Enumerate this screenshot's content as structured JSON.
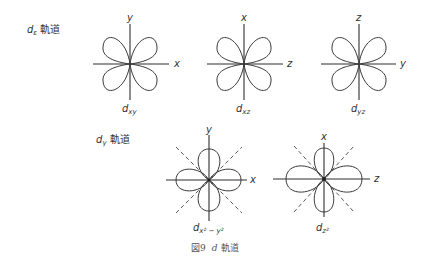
{
  "groups": [
    {
      "label_main": "d",
      "label_sub": "ε",
      "label_suffix": "軌道",
      "orbitals": [
        {
          "name": "d_xy",
          "label_main": "d",
          "label_sub": "xy",
          "label_sup": "",
          "axis_h": "x",
          "axis_v": "y"
        },
        {
          "name": "d_xz",
          "label_main": "d",
          "label_sub": "xz",
          "label_sup": "",
          "axis_h": "z",
          "axis_v": "x"
        },
        {
          "name": "d_yz",
          "label_main": "d",
          "label_sub": "yz",
          "label_sup": "",
          "axis_h": "y",
          "axis_v": "z"
        }
      ]
    },
    {
      "label_main": "d",
      "label_sub": "γ",
      "label_suffix": "軌道",
      "orbitals": [
        {
          "name": "d_x2-y2",
          "label_main": "d",
          "label_sub": "x² − y²",
          "axis_h": "x",
          "axis_v": "y"
        },
        {
          "name": "d_z2",
          "label_main": "d",
          "label_sub": "z²",
          "axis_h": "z",
          "axis_v": "x"
        }
      ]
    }
  ],
  "caption": {
    "number": "図9",
    "italic": "d",
    "text": "軌道"
  }
}
